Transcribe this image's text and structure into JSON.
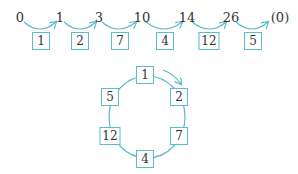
{
  "colors": {
    "accent": "#5bbccc",
    "text": "#333333"
  },
  "sequence": {
    "nodes": [
      "0",
      "1",
      "3",
      "10",
      "14",
      "26",
      "(0)"
    ],
    "steps": [
      "1",
      "2",
      "7",
      "4",
      "12",
      "5"
    ]
  },
  "cycle": {
    "boxes": [
      "1",
      "2",
      "7",
      "4",
      "12",
      "5"
    ],
    "direction": "clockwise"
  }
}
